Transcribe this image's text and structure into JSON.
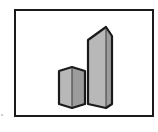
{
  "icon": {
    "name": "bar-chart-pictogram",
    "description": "Framed pictogram of two 3D prism bars (short and tall)",
    "bars": [
      {
        "label": "short-bar",
        "relative_height": "short"
      },
      {
        "label": "tall-bar",
        "relative_height": "tall"
      }
    ]
  },
  "colors": {
    "frame_border": "#1a1a1a",
    "background": "#ffffff",
    "bar_front": "#b4b4b4",
    "bar_side": "#9a9a9a",
    "bar_outline": "#1a1a1a"
  }
}
